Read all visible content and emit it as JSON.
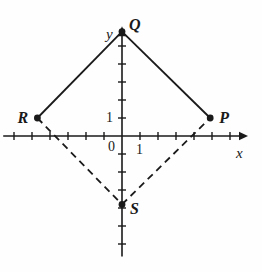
{
  "figure": {
    "kind": "cartesian-coordinate-plane",
    "background_color": "#fefefe",
    "ink_color": "#1a1a1a"
  },
  "axes": {
    "x_label": "x",
    "y_label": "y",
    "origin_label": "0",
    "x_unit_label": "1",
    "y_unit_label": "1",
    "origin_px": {
      "x": 122,
      "y": 136
    },
    "tick_spacing_px": 18,
    "x_range": [
      -6.6,
      7.0
    ],
    "y_range": [
      -6.7,
      6.1
    ],
    "x_ticks": [
      -6,
      -5,
      -4,
      -3,
      -2,
      -1,
      1,
      2,
      3,
      4,
      5,
      6
    ],
    "y_ticks": [
      -6,
      -5,
      -4,
      -3,
      -2,
      -1,
      1,
      2,
      3,
      4,
      5
    ],
    "grid": "off",
    "arrowheads": [
      "x-positive",
      "y-positive"
    ]
  },
  "points": [
    {
      "name": "Q",
      "label": "Q",
      "x": 0,
      "y": 5.8,
      "label_dx": 7,
      "label_dy": -15
    },
    {
      "name": "P",
      "label": "P",
      "x": 4.9,
      "y": 1.0,
      "label_dx": 9,
      "label_dy": -8
    },
    {
      "name": "R",
      "label": "R",
      "x": -4.7,
      "y": 1.0,
      "label_dx": -20,
      "label_dy": -8
    },
    {
      "name": "S",
      "label": "S",
      "x": 0,
      "y": -3.8,
      "label_dx": 8,
      "label_dy": -3
    }
  ],
  "edges": [
    {
      "name": "edge-R-Q",
      "from": "R",
      "to": "Q",
      "style": "solid"
    },
    {
      "name": "edge-Q-P",
      "from": "Q",
      "to": "P",
      "style": "solid"
    },
    {
      "name": "edge-R-S",
      "from": "R",
      "to": "S",
      "style": "dashed"
    },
    {
      "name": "edge-S-P",
      "from": "S",
      "to": "P",
      "style": "dashed"
    }
  ],
  "chart_data": {
    "type": "scatter",
    "title": "",
    "xlabel": "x",
    "ylabel": "y",
    "xlim": [
      -6.6,
      7.0
    ],
    "ylim": [
      -6.7,
      6.1
    ],
    "grid": false,
    "series": [
      {
        "name": "quadrilateral-vertices",
        "labels": [
          "Q",
          "P",
          "S",
          "R"
        ],
        "x": [
          0,
          4.9,
          0,
          -4.7
        ],
        "y": [
          5.8,
          1.0,
          -3.8,
          1.0
        ]
      }
    ],
    "annotations": [
      {
        "text": "Q",
        "x": 0,
        "y": 5.8
      },
      {
        "text": "P",
        "x": 4.9,
        "y": 1.0
      },
      {
        "text": "R",
        "x": -4.7,
        "y": 1.0
      },
      {
        "text": "S",
        "x": 0,
        "y": -3.8
      },
      {
        "text": "0",
        "x": -0.4,
        "y": -0.7
      },
      {
        "text": "1",
        "x": 1.0,
        "y": -0.9
      },
      {
        "text": "1",
        "x": -0.8,
        "y": 1.0
      }
    ]
  }
}
